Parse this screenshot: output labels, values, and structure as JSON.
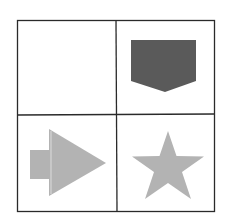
{
  "diagram": {
    "type": "2x2 shape grid",
    "colors": {
      "border": "#2a2a2a",
      "dark_fill": "#5a5a5a",
      "light_fill": "#b3b3b3",
      "background": "#ffffff"
    },
    "cells": [
      {
        "row": 0,
        "col": 0,
        "shape": "empty"
      },
      {
        "row": 0,
        "col": 1,
        "shape": "pentagon-down-pointing",
        "fill": "dark"
      },
      {
        "row": 1,
        "col": 0,
        "shape": "right-arrow",
        "fill": "light"
      },
      {
        "row": 1,
        "col": 1,
        "shape": "five-point-star",
        "fill": "light"
      }
    ]
  }
}
